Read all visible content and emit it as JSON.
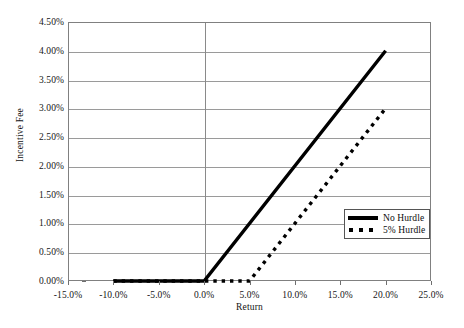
{
  "chart_data": {
    "type": "line",
    "title": "",
    "xlabel": "Return",
    "ylabel": "Incentive Fee",
    "xlim": [
      -15.0,
      25.0
    ],
    "ylim": [
      0.0,
      4.5
    ],
    "grid": true,
    "x_tick_labels": [
      "-15.0%",
      "-10.0%",
      "-5.0%",
      "0.0%",
      "5.0%",
      "10.0%",
      "15.0%",
      "20.0%",
      "25.0%"
    ],
    "x_tick_values": [
      -15.0,
      -10.0,
      -5.0,
      0.0,
      5.0,
      10.0,
      15.0,
      20.0,
      25.0
    ],
    "y_tick_labels": [
      "0.00%",
      "0.50%",
      "1.00%",
      "1.50%",
      "2.00%",
      "2.50%",
      "3.00%",
      "3.50%",
      "4.00%",
      "4.50%"
    ],
    "y_tick_values": [
      0.0,
      0.5,
      1.0,
      1.5,
      2.0,
      2.5,
      3.0,
      3.5,
      4.0,
      4.5
    ],
    "legend_position": "lower-right",
    "series": [
      {
        "name": "No Hurdle",
        "style": "solid",
        "color": "#000000",
        "width": 3.4,
        "points": [
          {
            "x": -10.0,
            "y": 0.0
          },
          {
            "x": 0.0,
            "y": 0.0
          },
          {
            "x": 20.0,
            "y": 4.0
          }
        ]
      },
      {
        "name": "5% Hurdle",
        "style": "dotted",
        "color": "#000000",
        "width": 3.4,
        "points": [
          {
            "x": -10.0,
            "y": 0.0
          },
          {
            "x": 5.0,
            "y": 0.0
          },
          {
            "x": 20.0,
            "y": 3.0
          }
        ]
      }
    ]
  },
  "legend": {
    "items": [
      {
        "label": "No Hurdle",
        "style": "solid"
      },
      {
        "label": "5% Hurdle",
        "style": "dotted"
      }
    ]
  },
  "axes": {
    "x_title": "Return",
    "y_title": "Incentive Fee"
  }
}
